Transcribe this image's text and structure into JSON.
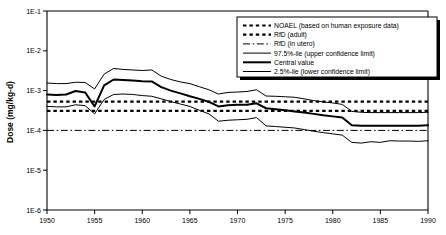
{
  "chart_data": {
    "type": "line",
    "title": "",
    "xlabel": "",
    "ylabel": "Dose (mg/kg-d)",
    "xlim": [
      1950,
      1990
    ],
    "ylim": [
      1e-06,
      0.1
    ],
    "yscale": "log",
    "grid": false,
    "legend_position": "top-right",
    "xticks": [
      "1950",
      "1955",
      "1960",
      "1965",
      "1970",
      "1975",
      "1980",
      "1985",
      "1990"
    ],
    "xtick_values": [
      1950,
      1955,
      1960,
      1965,
      1970,
      1975,
      1980,
      1985,
      1990
    ],
    "yticks": [
      "1E-1",
      "1E-2",
      "1E-3",
      "1E-4",
      "1E-5",
      "1E-6"
    ],
    "ytick_values": [
      0.1,
      0.01,
      0.001,
      0.0001,
      1e-05,
      1e-06
    ],
    "x": [
      1950,
      1951,
      1952,
      1953,
      1954,
      1955,
      1956,
      1957,
      1958,
      1959,
      1960,
      1961,
      1962,
      1963,
      1964,
      1965,
      1966,
      1967,
      1968,
      1969,
      1970,
      1971,
      1972,
      1973,
      1974,
      1975,
      1976,
      1977,
      1978,
      1979,
      1980,
      1981,
      1982,
      1983,
      1984,
      1985,
      1986,
      1987,
      1988,
      1989,
      1990
    ],
    "series": [
      {
        "name": "97.5%-ile (upper confidence limit)",
        "style": "solid-thin",
        "color": "#000000",
        "width": 1.0,
        "values": [
          0.00155,
          0.0015,
          0.0015,
          0.00162,
          0.0016,
          0.0011,
          0.0026,
          0.0036,
          0.0034,
          0.0033,
          0.0032,
          0.0033,
          0.0023,
          0.0019,
          0.00165,
          0.0015,
          0.00125,
          0.00105,
          0.00082,
          0.0009,
          0.00092,
          0.00095,
          0.00105,
          0.00073,
          0.00072,
          0.0007,
          0.00068,
          0.00062,
          0.00056,
          0.00052,
          0.00049,
          0.00045,
          0.0003,
          0.000285,
          0.00028,
          0.00028,
          0.00028,
          0.00028,
          0.00028,
          0.00028,
          0.000285
        ]
      },
      {
        "name": "Central value",
        "style": "solid-thick",
        "color": "#000000",
        "width": 2.0,
        "values": [
          0.0008,
          0.00078,
          0.0008,
          0.00098,
          0.0009,
          0.0004,
          0.00135,
          0.0019,
          0.00185,
          0.0018,
          0.00172,
          0.0017,
          0.00122,
          0.001,
          0.00085,
          0.00072,
          0.00062,
          0.00052,
          0.0004,
          0.00043,
          0.00044,
          0.00044,
          0.00048,
          0.00036,
          0.00034,
          0.00032,
          0.0003,
          0.00028,
          0.00026,
          0.00024,
          0.000225,
          0.00021,
          0.000135,
          0.00013,
          0.00013,
          0.00013,
          0.00013,
          0.00013,
          0.00013,
          0.00013,
          0.000135
        ]
      },
      {
        "name": "2.5%-ile (lower confidence limit)",
        "style": "solid-thin",
        "color": "#000000",
        "width": 1.0,
        "values": [
          0.0004,
          0.00039,
          0.00039,
          0.00044,
          0.00042,
          0.00026,
          0.0006,
          0.0008,
          0.00082,
          0.0008,
          0.00075,
          0.00072,
          0.00062,
          0.00053,
          0.00046,
          0.0004,
          0.00032,
          0.00026,
          0.00017,
          0.00018,
          0.000185,
          0.00019,
          0.00021,
          0.00013,
          0.000125,
          0.00012,
          0.000115,
          0.000105,
          9.5e-05,
          8.8e-05,
          8.2e-05,
          7.6e-05,
          5e-05,
          4.8e-05,
          5.2e-05,
          5e-05,
          5.5e-05,
          5.4e-05,
          5.4e-05,
          5.3e-05,
          5.5e-05
        ]
      }
    ],
    "reference_lines": [
      {
        "name": "NOAEL (based on human exposure data)",
        "style": "dashed-thick",
        "value": 0.00053,
        "color": "#000000",
        "width": 2.2
      },
      {
        "name": "RfD (adult)",
        "style": "dashed-thick",
        "value": 0.00031,
        "color": "#000000",
        "width": 2.2
      },
      {
        "name": "RfD (in utero)",
        "style": "dash-dot",
        "value": 0.0001,
        "color": "#000000",
        "width": 1.0
      }
    ]
  },
  "legend": {
    "items": [
      {
        "label": "NOAEL (based on human exposure data)",
        "style": "dashed-thick"
      },
      {
        "label": "RfD (adult)",
        "style": "dashed-thick"
      },
      {
        "label": "RfD (in utero)",
        "style": "dash-dot"
      },
      {
        "label": "97.5%-ile (upper confidence limit)",
        "style": "solid-thin"
      },
      {
        "label": "Central value",
        "style": "solid-thick"
      },
      {
        "label": "2.5%-ile (lower confidence limit)",
        "style": "solid-thin"
      }
    ]
  }
}
